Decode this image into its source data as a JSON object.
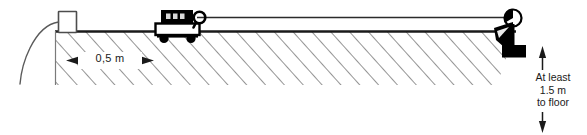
{
  "figure": {
    "type": "physics-apparatus-diagram",
    "colors": {
      "ink": "#1a1a1a",
      "hatch": "#7a7a7a",
      "string": "#2b2b2b",
      "mass_fill": "#000000",
      "trolley_body_fill": "#ffffff",
      "sensor_fill": "#ffffff",
      "background": "#ffffff"
    }
  },
  "annotations": {
    "horizontal_distance": {
      "value": "0,5 m",
      "name": "0.5 metre bench distance",
      "arrow_style": "double-headed"
    },
    "vertical_drop": {
      "line1": "At least",
      "line2": "1.5 m",
      "line3": "to floor",
      "full_text": "At least 1.5 m to floor",
      "arrow_style": "double-headed"
    }
  },
  "components": {
    "light_gate": "light-gate-sensor",
    "sensor_cable": "sensor-cable",
    "bench": "bench-surface",
    "hatching": "bench-section-hatching",
    "trolley": "trolley",
    "trolley_mass": "trolley-top-mass-block",
    "trolley_wheel_left": "trolley-wheel-left",
    "trolley_wheel_right": "trolley-wheel-right",
    "trolley_hook": "trolley-hook-loop",
    "string": "connecting-string",
    "pulley": "pulley-wheel",
    "pulley_clamp": "pulley-bench-clamp",
    "hanging_mass": "hanging-mass",
    "hanger_rod": "mass-hanger-rod"
  }
}
